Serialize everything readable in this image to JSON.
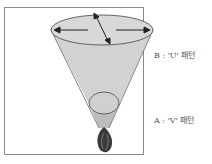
{
  "diagram": {
    "type": "fire-plume-cone",
    "labels": {
      "b": "B : 'U' 패턴",
      "a": "A : 'V' 패턴"
    },
    "colors": {
      "frame": "#8a8a8a",
      "cone_fill": "#d2d2d2",
      "cone_lower_fill": "#bdbdbd",
      "outline": "#555555",
      "arrow": "#222222",
      "flame_dark": "#3a3a3a",
      "flame_mid": "#777777"
    }
  }
}
